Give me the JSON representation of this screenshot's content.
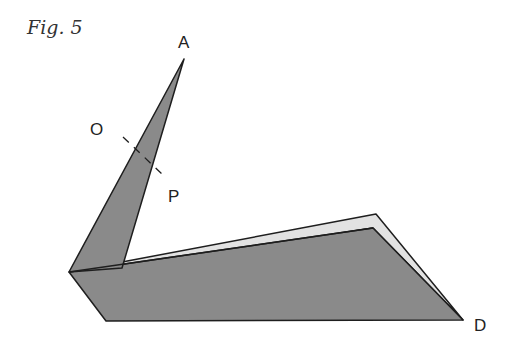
{
  "figure": {
    "caption": "Fig. 5",
    "points": {
      "A": "A",
      "O": "O",
      "P": "P",
      "D": "D"
    },
    "colors": {
      "paper_grey": "#8a8a8a",
      "paper_light": "#e2e2e2",
      "outline": "#1e1e1e",
      "background": "#ffffff"
    }
  }
}
